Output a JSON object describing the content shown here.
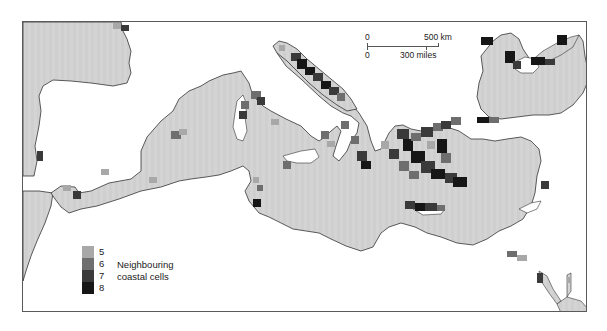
{
  "map": {
    "subject": "Mediterranean and Black Sea coastal connectivity",
    "sea_color": "#d4d4d4",
    "land_color": "#ffffff",
    "coast_color": "#333333",
    "scale_bar": {
      "top_zero": "0",
      "top_label": "500 km",
      "bottom_zero": "0",
      "bottom_label": "300 miles"
    },
    "legend": {
      "title_line1": "Neighbouring",
      "title_line2": "coastal cells",
      "items": [
        {
          "value": "5",
          "color": "#a8a8a8"
        },
        {
          "value": "6",
          "color": "#6e6e6e"
        },
        {
          "value": "7",
          "color": "#3a3a3a"
        },
        {
          "value": "8",
          "color": "#161616"
        }
      ]
    }
  }
}
